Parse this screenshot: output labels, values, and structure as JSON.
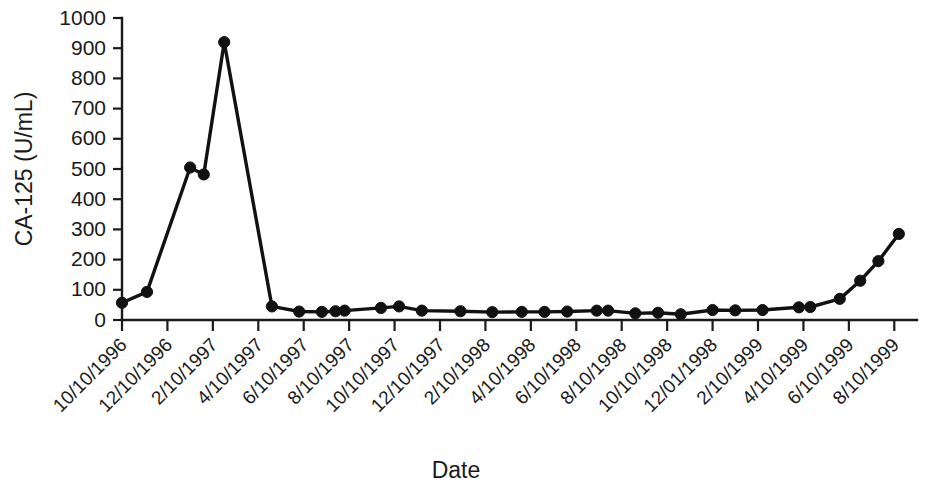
{
  "chart_data": {
    "type": "line",
    "title": "",
    "xlabel": "Date",
    "ylabel": "CA-125 (U/mL)",
    "ylim": [
      0,
      1000
    ],
    "y_ticks": [
      0,
      100,
      200,
      300,
      400,
      500,
      600,
      700,
      800,
      900,
      1000
    ],
    "grid": false,
    "legend": null,
    "marker": "filled-circle",
    "x_tick_labels": [
      "10/10/1996",
      "12/10/1996",
      "2/10/1997",
      "4/10/1997",
      "6/10/1997",
      "8/10/1997",
      "10/10/1997",
      "12/10/1997",
      "2/10/1998",
      "4/10/1998",
      "6/10/1998",
      "8/10/1998",
      "10/10/1998",
      "12/01/1998",
      "2/10/1999",
      "4/10/1999",
      "6/10/1999",
      "8/10/1999"
    ],
    "x_tick_values": [
      0,
      2,
      4,
      6,
      8,
      10,
      12,
      14,
      16,
      18,
      20,
      22,
      24,
      26,
      28,
      30,
      32,
      34
    ],
    "xlim": [
      0,
      35
    ],
    "x_unit": "months since 10/10/1996",
    "series": [
      {
        "name": "CA-125",
        "x": [
          0.0,
          1.1,
          3.0,
          3.6,
          4.5,
          6.6,
          7.8,
          8.8,
          9.4,
          9.8,
          11.4,
          12.2,
          13.2,
          14.9,
          16.3,
          17.6,
          18.6,
          19.6,
          20.9,
          21.4,
          22.6,
          23.6,
          24.6,
          26.0,
          27.0,
          28.2,
          29.8,
          30.3,
          31.6,
          32.5,
          33.3,
          34.2
        ],
        "values": [
          57,
          93,
          505,
          482,
          920,
          45,
          28,
          27,
          29,
          31,
          40,
          45,
          31,
          29,
          26,
          27,
          27,
          28,
          31,
          31,
          22,
          24,
          19,
          33,
          32,
          33,
          42,
          43,
          70,
          130,
          195,
          285
        ]
      }
    ]
  }
}
